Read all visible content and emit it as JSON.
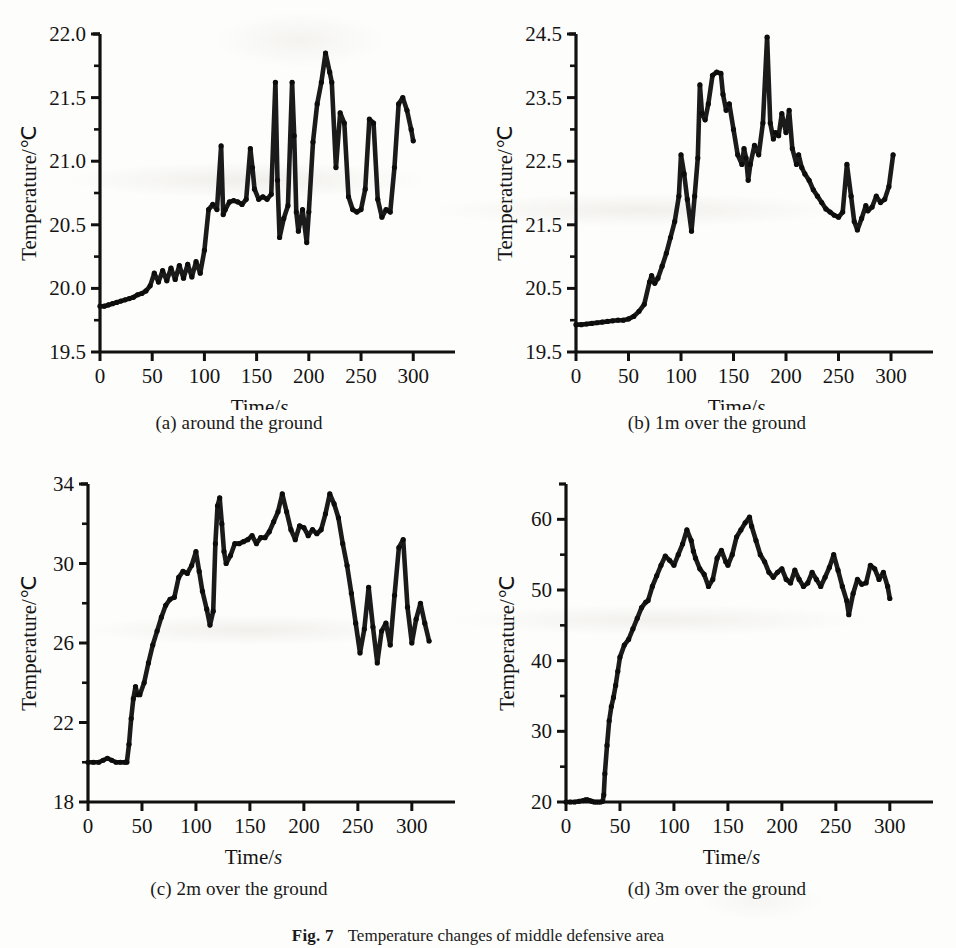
{
  "figure": {
    "caption_label": "Fig. 7",
    "caption_text": "Temperature changes of middle defensive area"
  },
  "axes_common": {
    "x_label_main": "Time/",
    "x_label_italic": "s",
    "y_label": "Temperature/℃"
  },
  "panels": [
    {
      "id": "a",
      "caption": "(a) around the ground",
      "chart": {
        "type": "line",
        "title": "(a) around the ground",
        "xlabel": "Time/s",
        "ylabel": "Temperature/℃",
        "xlim": [
          0,
          340
        ],
        "ylim": [
          19.5,
          22.0
        ],
        "xticks": [
          0,
          50,
          100,
          150,
          200,
          250,
          300
        ],
        "yticks": [
          19.5,
          20.0,
          20.5,
          21.0,
          21.5,
          22.0
        ],
        "minor_y_ticks": [
          19.75,
          20.25,
          20.75,
          21.25,
          21.75
        ],
        "grid": false,
        "legend": null,
        "marker": "filled-circle",
        "x": [
          0,
          4,
          8,
          12,
          16,
          20,
          24,
          28,
          32,
          36,
          40,
          44,
          48,
          52,
          56,
          60,
          64,
          68,
          72,
          76,
          80,
          84,
          88,
          92,
          96,
          100,
          104,
          108,
          112,
          116,
          118,
          120,
          124,
          128,
          132,
          136,
          140,
          144,
          146,
          148,
          152,
          156,
          160,
          164,
          168,
          170,
          172,
          176,
          180,
          184,
          186,
          188,
          190,
          194,
          198,
          200,
          204,
          208,
          212,
          216,
          220,
          222,
          226,
          230,
          234,
          238,
          242,
          246,
          250,
          254,
          258,
          262,
          266,
          270,
          274,
          278,
          282,
          286,
          290,
          294,
          298,
          300
        ],
        "y": [
          19.86,
          19.86,
          19.87,
          19.88,
          19.89,
          19.9,
          19.91,
          19.92,
          19.93,
          19.95,
          19.96,
          19.98,
          20.02,
          20.12,
          20.05,
          20.14,
          20.06,
          20.16,
          20.07,
          20.18,
          20.08,
          20.19,
          20.09,
          20.21,
          20.12,
          20.3,
          20.62,
          20.66,
          20.62,
          21.12,
          20.58,
          20.62,
          20.68,
          20.69,
          20.68,
          20.66,
          20.7,
          21.1,
          20.95,
          20.78,
          20.7,
          20.72,
          20.7,
          20.74,
          21.62,
          20.85,
          20.4,
          20.55,
          20.65,
          21.62,
          21.2,
          20.6,
          20.45,
          20.62,
          20.36,
          20.6,
          21.15,
          21.45,
          21.62,
          21.85,
          21.7,
          21.62,
          20.95,
          21.38,
          21.3,
          20.72,
          20.62,
          20.6,
          20.62,
          20.78,
          21.33,
          21.3,
          20.7,
          20.56,
          20.62,
          20.6,
          20.95,
          21.45,
          21.5,
          21.4,
          21.25,
          21.16
        ]
      }
    },
    {
      "id": "b",
      "caption": "(b) 1m over the ground",
      "chart": {
        "type": "line",
        "title": "(b) 1m over the ground",
        "xlabel": "Time/s",
        "ylabel": "Temperature/℃",
        "xlim": [
          0,
          340
        ],
        "ylim": [
          19.5,
          24.5
        ],
        "xticks": [
          0,
          50,
          100,
          150,
          200,
          250,
          300
        ],
        "yticks": [
          19.5,
          20.5,
          21.5,
          22.5,
          23.5,
          24.5
        ],
        "minor_y_ticks": [
          20.0,
          21.0,
          22.0,
          23.0,
          24.0
        ],
        "grid": false,
        "legend": null,
        "marker": "filled-circle",
        "x": [
          0,
          5,
          10,
          15,
          20,
          25,
          30,
          35,
          40,
          45,
          50,
          55,
          60,
          65,
          70,
          72,
          75,
          78,
          82,
          86,
          90,
          94,
          98,
          100,
          103,
          106,
          110,
          113,
          116,
          118,
          120,
          123,
          126,
          130,
          134,
          138,
          140,
          143,
          146,
          150,
          154,
          158,
          160,
          162,
          164,
          166,
          170,
          174,
          178,
          182,
          185,
          188,
          190,
          193,
          196,
          200,
          203,
          206,
          210,
          212,
          215,
          218,
          222,
          226,
          230,
          234,
          238,
          242,
          246,
          250,
          254,
          258,
          262,
          265,
          268,
          272,
          276,
          278,
          282,
          286,
          290,
          294,
          298,
          302
        ],
        "y": [
          19.93,
          19.93,
          19.94,
          19.95,
          19.96,
          19.97,
          19.98,
          19.99,
          20.0,
          20.0,
          20.02,
          20.06,
          20.14,
          20.25,
          20.6,
          20.7,
          20.58,
          20.66,
          20.85,
          21.05,
          21.3,
          21.55,
          21.95,
          22.6,
          22.3,
          21.9,
          21.4,
          21.95,
          22.55,
          23.7,
          23.25,
          23.15,
          23.4,
          23.85,
          23.9,
          23.88,
          23.55,
          23.3,
          23.4,
          23.0,
          22.6,
          22.45,
          22.7,
          22.55,
          22.2,
          22.45,
          22.75,
          22.6,
          23.1,
          24.45,
          23.1,
          22.85,
          22.95,
          22.9,
          23.25,
          22.95,
          23.3,
          22.7,
          22.45,
          22.6,
          22.4,
          22.3,
          22.2,
          22.05,
          21.95,
          21.85,
          21.75,
          21.7,
          21.65,
          21.62,
          21.7,
          22.45,
          21.95,
          21.55,
          21.42,
          21.6,
          21.8,
          21.72,
          21.78,
          21.95,
          21.85,
          21.9,
          22.1,
          22.6
        ]
      }
    },
    {
      "id": "c",
      "caption": "(c) 2m over the ground",
      "chart": {
        "type": "line",
        "title": "(c) 2m over the ground",
        "xlabel": "Time/s",
        "ylabel": "Temperature/℃",
        "xlim": [
          0,
          340
        ],
        "ylim": [
          18,
          34
        ],
        "xticks": [
          0,
          50,
          100,
          150,
          200,
          250,
          300
        ],
        "yticks": [
          18,
          22,
          26,
          30,
          34
        ],
        "minor_y_ticks": [
          20,
          24,
          28,
          32
        ],
        "grid": false,
        "legend": null,
        "marker": "filled-circle",
        "x": [
          0,
          5,
          10,
          14,
          18,
          22,
          26,
          30,
          34,
          36,
          38,
          40,
          42,
          44,
          46,
          48,
          52,
          56,
          60,
          64,
          68,
          72,
          76,
          80,
          84,
          88,
          92,
          96,
          100,
          103,
          106,
          110,
          113,
          116,
          118,
          120,
          122,
          124,
          126,
          128,
          132,
          136,
          140,
          144,
          148,
          152,
          156,
          160,
          164,
          168,
          172,
          176,
          180,
          184,
          188,
          192,
          196,
          200,
          204,
          208,
          212,
          216,
          220,
          224,
          228,
          232,
          236,
          240,
          244,
          248,
          252,
          256,
          260,
          264,
          268,
          272,
          276,
          280,
          284,
          288,
          292,
          296,
          300,
          304,
          308,
          312,
          316
        ],
        "y": [
          20.0,
          20.0,
          20.0,
          20.1,
          20.2,
          20.1,
          20.0,
          20.0,
          20.0,
          20.0,
          20.9,
          22.2,
          23.2,
          23.8,
          23.4,
          23.4,
          24.0,
          25.0,
          25.9,
          26.6,
          27.3,
          27.9,
          28.2,
          28.3,
          29.3,
          29.6,
          29.5,
          29.9,
          30.6,
          29.6,
          28.6,
          27.7,
          26.9,
          27.6,
          31.0,
          32.9,
          33.3,
          32.0,
          30.6,
          30.0,
          30.4,
          31.0,
          31.0,
          31.1,
          31.2,
          31.4,
          31.0,
          31.3,
          31.3,
          31.6,
          32.1,
          32.6,
          33.5,
          32.6,
          31.7,
          31.2,
          31.9,
          31.8,
          31.4,
          31.7,
          31.5,
          31.7,
          32.5,
          33.5,
          33.0,
          32.3,
          31.0,
          29.9,
          28.5,
          27.0,
          25.5,
          26.7,
          28.8,
          26.8,
          25.0,
          26.6,
          27.0,
          25.9,
          28.4,
          30.8,
          31.2,
          27.8,
          26.0,
          27.2,
          28.0,
          27.0,
          26.1
        ]
      }
    },
    {
      "id": "d",
      "caption": "(d) 3m over the ground",
      "chart": {
        "type": "line",
        "title": "(d) 3m over the ground",
        "xlabel": "Time/s",
        "ylabel": "Temperature/℃",
        "xlim": [
          0,
          340
        ],
        "ylim": [
          20,
          65
        ],
        "xticks": [
          0,
          50,
          100,
          150,
          200,
          250,
          300
        ],
        "yticks": [
          20,
          30,
          40,
          50,
          60
        ],
        "minor_y_ticks": [
          25,
          35,
          45,
          55
        ],
        "grid": false,
        "legend": null,
        "marker": "filled-circle",
        "x": [
          0,
          4,
          8,
          12,
          16,
          18,
          20,
          22,
          24,
          26,
          28,
          30,
          32,
          34,
          35,
          36,
          38,
          40,
          42,
          44,
          46,
          48,
          50,
          54,
          58,
          62,
          66,
          70,
          74,
          76,
          80,
          84,
          88,
          92,
          96,
          100,
          104,
          108,
          112,
          116,
          118,
          120,
          124,
          128,
          132,
          136,
          140,
          144,
          148,
          150,
          154,
          158,
          162,
          166,
          170,
          172,
          176,
          180,
          184,
          188,
          192,
          196,
          200,
          204,
          208,
          212,
          216,
          220,
          224,
          228,
          232,
          236,
          240,
          244,
          248,
          252,
          256,
          260,
          262,
          266,
          270,
          274,
          278,
          282,
          286,
          290,
          294,
          298,
          300
        ],
        "y": [
          20.0,
          20.0,
          20.0,
          20.1,
          20.2,
          20.3,
          20.3,
          20.2,
          20.1,
          20.0,
          20.0,
          20.0,
          20.0,
          20.1,
          21.0,
          24.0,
          28.0,
          31.5,
          33.5,
          34.8,
          36.5,
          38.5,
          40.5,
          42.2,
          43.0,
          44.5,
          46.0,
          47.5,
          48.3,
          48.5,
          50.5,
          52.0,
          53.5,
          54.8,
          54.2,
          53.5,
          55.0,
          56.5,
          58.5,
          57.0,
          55.5,
          54.5,
          53.0,
          52.2,
          50.5,
          51.5,
          54.5,
          55.6,
          54.0,
          53.5,
          55.0,
          57.5,
          58.5,
          59.5,
          60.3,
          59.0,
          57.0,
          55.0,
          54.0,
          52.5,
          51.8,
          52.5,
          53.0,
          51.5,
          51.0,
          52.8,
          51.5,
          50.5,
          51.0,
          52.5,
          51.5,
          50.5,
          51.8,
          53.2,
          55.0,
          52.8,
          50.5,
          48.5,
          46.5,
          49.5,
          51.5,
          50.8,
          51.0,
          53.5,
          53.0,
          51.5,
          52.5,
          50.5,
          48.8
        ]
      }
    }
  ]
}
